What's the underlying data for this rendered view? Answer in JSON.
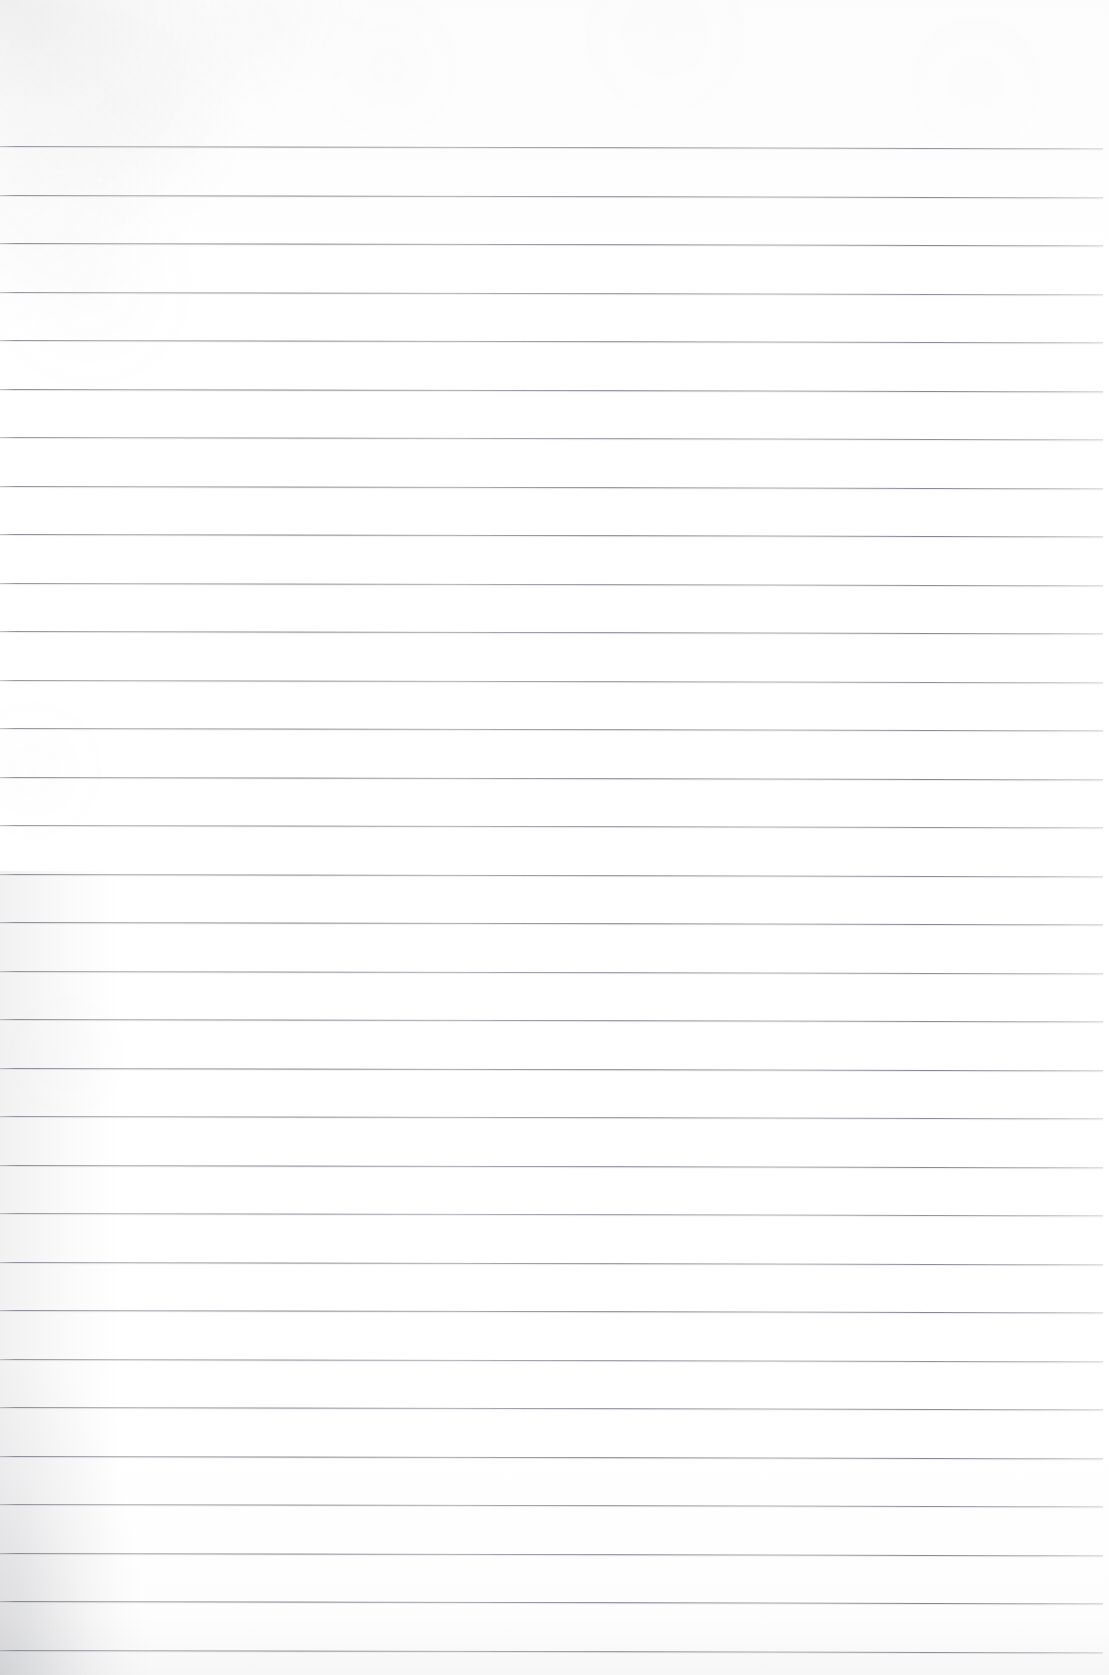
{
  "document": {
    "kind": "scanned-ruled-notebook-page",
    "title": "Blank Ruled Notebook Page",
    "page_width": 1109,
    "page_height": 1675,
    "background_color": "#fdfdfd",
    "has_text": false,
    "has_handwriting": false,
    "has_margin_rule": false,
    "header_text": "",
    "footer_text": "",
    "page_number": ""
  },
  "ruling": {
    "line_color": "#7a7a84",
    "line_thickness_px": 1,
    "line_count": 32,
    "first_line_y": 146,
    "line_spacing_px": 48.5,
    "last_line_y": 1649,
    "line_start_x": 0,
    "line_end_x": 1103,
    "skew_degrees": 0.12,
    "y_positions": [
      146,
      194.5,
      243,
      291.5,
      340,
      388.5,
      437,
      485.5,
      534,
      582.5,
      631,
      679.5,
      728,
      776.5,
      825,
      873.5,
      922,
      970.5,
      1019,
      1067.5,
      1116,
      1164.5,
      1213,
      1261.5,
      1310,
      1358.5,
      1407,
      1455.5,
      1504,
      1552.5,
      1601,
      1649.5
    ]
  },
  "artifacts": {
    "paper_texture": "faint-fiber-grain",
    "shadows": [
      {
        "name": "bottom-left-scanner-shadow",
        "color": "#787a82",
        "opacity": 0.2,
        "position": "bottom-left"
      },
      {
        "name": "left-edge-wash",
        "color": "#7d7f87",
        "opacity": 0.11,
        "position": "left-lower"
      },
      {
        "name": "top-left-smudge",
        "color": "#828490",
        "opacity": 0.085,
        "position": "top-left"
      },
      {
        "name": "bottom-edge-wash",
        "color": "#80828a",
        "opacity": 0.055,
        "position": "bottom"
      }
    ],
    "top_margin_px": 146,
    "bottom_margin_px": 25
  }
}
